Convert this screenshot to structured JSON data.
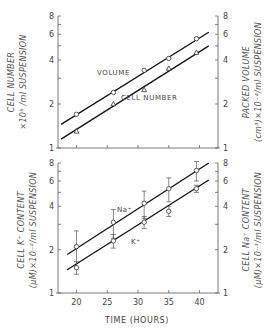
{
  "chart_data": [
    {
      "type": "line",
      "panel": "top",
      "title": "",
      "xlabel": "TIME (HOURS)",
      "ylabel_left": "CELL NUMBER ×10^5 /ml SUSPENSION",
      "ylabel_right": "PACKED VOLUME (cm^3) ×10^-4 /ml SUSPENSION",
      "yscale": "log",
      "ylim": [
        1,
        8
      ],
      "xlim": [
        17,
        43
      ],
      "yticks_labeled": [
        "1",
        "2",
        "4",
        "6",
        "8"
      ],
      "grid": false,
      "series": [
        {
          "name": "VOLUME",
          "marker": "circle",
          "x": [
            20,
            26,
            31,
            35,
            39.5
          ],
          "values": [
            1.7,
            2.4,
            3.4,
            4.1,
            5.6
          ],
          "fit_line": {
            "x": [
              17.5,
              41.5
            ],
            "y": [
              1.45,
              6.2
            ]
          }
        },
        {
          "name": "CELL NUMBER",
          "marker": "triangle",
          "x": [
            20,
            26,
            31,
            35,
            39.5
          ],
          "values": [
            1.3,
            2.0,
            2.5,
            3.5,
            4.5
          ],
          "fit_line": {
            "x": [
              17.5,
              41.5
            ],
            "y": [
              1.15,
              5.0
            ]
          }
        }
      ]
    },
    {
      "type": "line",
      "panel": "bottom",
      "title": "",
      "xlabel": "TIME (HOURS)",
      "ylabel_left": "CELL K+ CONTENT (µM)×10^-2 /ml SUSPENSION",
      "ylabel_right": "CELL Na+ CONTENT (µM)×10^-3 /ml SUSPENSION",
      "yscale": "log",
      "ylim": [
        1,
        8
      ],
      "xlim": [
        17,
        43
      ],
      "xticks": [
        20,
        25,
        30,
        35,
        40
      ],
      "yticks_labeled": [
        "1",
        "2",
        "4",
        "6",
        "8"
      ],
      "grid": false,
      "series": [
        {
          "name": "Na+",
          "marker": "circle",
          "x": [
            20,
            26,
            31,
            35,
            39.5
          ],
          "values": [
            2.1,
            3.1,
            4.2,
            5.3,
            7.1
          ],
          "error": [
            0.6,
            0.7,
            0.9,
            1.0,
            1.1
          ],
          "fit_line": {
            "x": [
              18.5,
              41.5
            ],
            "y": [
              1.85,
              8.0
            ]
          }
        },
        {
          "name": "K+",
          "marker": "circle",
          "x": [
            20,
            26,
            31,
            35,
            39.5
          ],
          "values": [
            1.5,
            2.3,
            3.1,
            3.7,
            5.3
          ],
          "error": [
            0.15,
            0.25,
            0.3,
            0.3,
            0.3
          ],
          "fit_line": {
            "x": [
              18.5,
              41.5
            ],
            "y": [
              1.45,
              6.1
            ]
          }
        }
      ]
    }
  ],
  "labels": {
    "top_left_line1": "CELL NUMBER",
    "top_left_line2": "×10⁵ /ml SUSPENSION",
    "top_right_line1": "PACKED VOLUME",
    "top_right_line2": "(cm³)×10⁻⁴/ml SUSPENSION",
    "bottom_left_line1": "CELL K⁺ CONTENT",
    "bottom_left_line2": "(µM)×10⁻²/ml SUSPENSION",
    "bottom_right_line1": "CELL Na⁺ CONTENT",
    "bottom_right_line2": "(µM)×10⁻³/ml SUSPENSION",
    "volume_annotation": "VOLUME",
    "cell_number_annotation": "CELL NUMBER",
    "na_annotation": "Na⁺",
    "k_annotation": "K⁺",
    "x_axis_title": "TIME (HOURS)",
    "xticks": [
      "20",
      "25",
      "30",
      "35",
      "40"
    ],
    "yticks": [
      "1",
      "2",
      "4",
      "6",
      "8"
    ]
  }
}
